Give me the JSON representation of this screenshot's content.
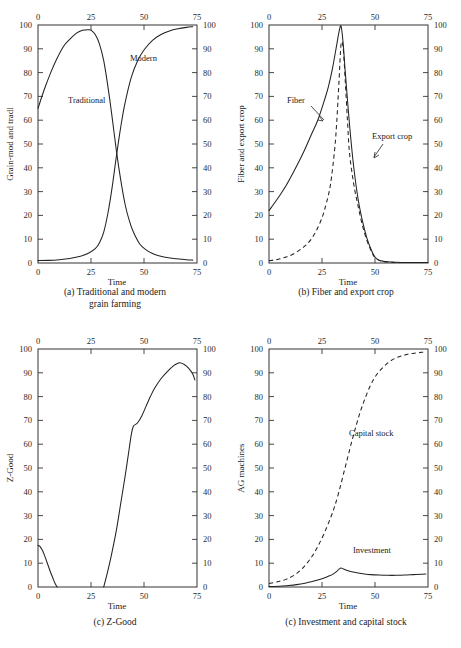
{
  "figure": {
    "panel_count": 4,
    "shared": {
      "xlabel": "Time",
      "xticks": [
        0,
        25,
        50,
        75
      ],
      "yticks": [
        0,
        10,
        20,
        30,
        40,
        50,
        60,
        70,
        80,
        90,
        100
      ],
      "xlim": [
        0,
        75
      ],
      "ylim": [
        0,
        100
      ],
      "line_color": "#222222",
      "frame_color": "#333333",
      "background": "#ffffff"
    }
  },
  "panel_a": {
    "caption_line1": "(a) Traditional and modern",
    "caption_line2": "grain farming",
    "ylabel": "Grain-mod and tradl",
    "xlabel": "Time",
    "xticks": [
      "0",
      "25",
      "50",
      "75"
    ],
    "yticks": [
      "0",
      "10",
      "20",
      "30",
      "40",
      "50",
      "60",
      "70",
      "80",
      "90",
      "100"
    ],
    "labels": {
      "traditional": "Traditional",
      "modern": "Modern"
    },
    "chart_data": {
      "type": "line",
      "title": "(a) Traditional and modern grain farming",
      "xlabel": "Time",
      "ylabel": "Grain-mod and tradl",
      "xlim": [
        0,
        75
      ],
      "ylim": [
        0,
        100
      ],
      "grid": false,
      "legend": "inline-annotations",
      "series": [
        {
          "name": "Traditional",
          "style": "solid",
          "x": [
            0,
            3,
            6,
            9,
            12,
            15,
            18,
            21,
            24,
            25,
            27,
            29,
            31,
            33,
            35,
            37,
            39,
            41,
            43,
            45,
            48,
            51,
            54,
            57,
            60,
            65,
            70,
            73
          ],
          "values": [
            65,
            73,
            80,
            86,
            91,
            94,
            96.5,
            97.8,
            98,
            97.8,
            96,
            92,
            85,
            74,
            61,
            47,
            35,
            25,
            18,
            13,
            8,
            5.5,
            4,
            3,
            2.4,
            1.8,
            1.4,
            1.2
          ]
        },
        {
          "name": "Modern",
          "style": "solid",
          "x": [
            0,
            5,
            10,
            15,
            20,
            24,
            27,
            29,
            31,
            33,
            35,
            37,
            39,
            41,
            44,
            47,
            50,
            54,
            58,
            62,
            66,
            70,
            73
          ],
          "values": [
            1,
            1.1,
            1.4,
            1.9,
            2.8,
            4.2,
            6,
            8.5,
            13,
            21,
            32,
            45,
            57,
            67,
            78,
            85,
            89.5,
            93.5,
            96,
            97.5,
            98.4,
            99,
            99.3
          ]
        }
      ]
    }
  },
  "panel_b": {
    "caption_line1": "(b) Fiber and export crop",
    "caption_line2": "",
    "ylabel": "Fiber and export crop",
    "xlabel": "Time",
    "xticks": [
      "0",
      "25",
      "50",
      "75"
    ],
    "yticks": [
      "0",
      "10",
      "20",
      "30",
      "40",
      "50",
      "60",
      "70",
      "80",
      "90",
      "100"
    ],
    "labels": {
      "fiber": "Fiber",
      "export_crop": "Export crop"
    },
    "chart_data": {
      "type": "line",
      "title": "(b) Fiber and export crop",
      "xlabel": "Time",
      "ylabel": "Fiber and export crop",
      "xlim": [
        0,
        75
      ],
      "ylim": [
        0,
        100
      ],
      "grid": false,
      "legend": "inline-annotations-with-arrows",
      "series": [
        {
          "name": "Fiber",
          "style": "solid",
          "x": [
            0,
            4,
            8,
            12,
            16,
            20,
            23,
            26,
            28,
            30,
            32,
            33,
            34,
            35,
            36,
            38,
            40,
            42,
            44,
            46,
            48,
            50,
            52,
            56,
            60,
            66,
            72,
            75
          ],
          "values": [
            22,
            27,
            32.5,
            39,
            46,
            54,
            60,
            68,
            74,
            82,
            92,
            97,
            99.5,
            92,
            80,
            58,
            40,
            27,
            18,
            11,
            6,
            2.5,
            1.2,
            0.5,
            0.3,
            0.2,
            0.2,
            0.2
          ]
        },
        {
          "name": "Export crop",
          "style": "dashed",
          "x": [
            0,
            4,
            8,
            12,
            16,
            19,
            22,
            25,
            27,
            29,
            31,
            32,
            33,
            34,
            35,
            36,
            37,
            38,
            40,
            42,
            44,
            46,
            48,
            50,
            53,
            58,
            65,
            72,
            75
          ],
          "values": [
            1,
            1.5,
            2.5,
            4,
            6.5,
            9,
            13,
            19,
            25,
            33,
            48,
            60,
            76,
            92,
            90,
            76,
            60,
            46,
            33,
            24,
            16,
            10,
            5.5,
            2.2,
            0.8,
            0.3,
            0.2,
            0.2,
            0.2
          ]
        }
      ]
    }
  },
  "panel_c": {
    "caption_line1": "(c) Z-Good",
    "caption_line2": "",
    "ylabel": "Z-Good",
    "xlabel": "Time",
    "xticks": [
      "0",
      "25",
      "50",
      "75"
    ],
    "yticks": [
      "0",
      "10",
      "20",
      "30",
      "40",
      "50",
      "60",
      "70",
      "80",
      "90",
      "100"
    ],
    "labels": {},
    "chart_data": {
      "type": "line",
      "title": "(c) Z-Good",
      "xlabel": "Time",
      "ylabel": "Z-Good",
      "xlim": [
        0,
        75
      ],
      "ylim": [
        0,
        100
      ],
      "grid": false,
      "legend": "none",
      "series": [
        {
          "name": "Z-Good (initial decline)",
          "style": "solid",
          "x": [
            0,
            1,
            2,
            3,
            4,
            5,
            6,
            7,
            8,
            9
          ],
          "values": [
            17.5,
            17,
            15.5,
            13.5,
            11,
            8.5,
            6,
            3.8,
            1.6,
            0
          ]
        },
        {
          "name": "Z-Good (recovery)",
          "style": "solid",
          "x": [
            31,
            33,
            35,
            37,
            39,
            41,
            43,
            44,
            45,
            47,
            49,
            51,
            53,
            55,
            58,
            61,
            64,
            66,
            67,
            69,
            71,
            73,
            74
          ],
          "values": [
            0,
            7,
            15,
            24,
            35,
            46,
            58,
            64,
            67.5,
            69,
            72,
            76,
            80,
            83.5,
            87.5,
            90.5,
            93,
            94,
            94.2,
            93.5,
            92,
            89.5,
            87
          ]
        }
      ]
    }
  },
  "panel_d": {
    "caption_line1": "(c) Investment and capital stock",
    "caption_line2": "",
    "ylabel": "AG machines",
    "xlabel": "Time",
    "xticks": [
      "0",
      "25",
      "50",
      "75"
    ],
    "yticks": [
      "0",
      "10",
      "20",
      "30",
      "40",
      "50",
      "60",
      "70",
      "80",
      "90",
      "100"
    ],
    "labels": {
      "capital_stock": "Capital stock",
      "investment": "Investment"
    },
    "chart_data": {
      "type": "line",
      "title": "(c) Investment and capital stock",
      "xlabel": "Time",
      "ylabel": "AG machines",
      "xlim": [
        0,
        75
      ],
      "ylim": [
        0,
        100
      ],
      "grid": false,
      "legend": "inline-annotations",
      "series": [
        {
          "name": "Capital stock",
          "style": "dashed",
          "x": [
            0,
            4,
            8,
            12,
            16,
            20,
            23,
            26,
            29,
            31,
            33,
            35,
            37,
            39,
            41,
            43,
            45,
            48,
            51,
            54,
            57,
            60,
            63,
            66,
            69,
            72,
            74
          ],
          "values": [
            1.5,
            2.2,
            3.2,
            5,
            8,
            12.5,
            17,
            22.5,
            29,
            34,
            40,
            47,
            54,
            61,
            67.5,
            73.5,
            78.5,
            85,
            89.5,
            92.5,
            94.8,
            96.3,
            97.2,
            97.9,
            98.3,
            98.6,
            98.8
          ]
        },
        {
          "name": "Investment",
          "style": "solid",
          "x": [
            0,
            5,
            9,
            13,
            17,
            20,
            23,
            26,
            28,
            30,
            32,
            33,
            34,
            35,
            37,
            39,
            42,
            45,
            48,
            52,
            56,
            60,
            64,
            68,
            72,
            74
          ],
          "values": [
            0.2,
            0.3,
            0.6,
            1.0,
            1.6,
            2.2,
            2.9,
            3.8,
            4.5,
            5.3,
            6.6,
            7.5,
            8.0,
            7.6,
            6.9,
            6.4,
            5.9,
            5.5,
            5.2,
            5.0,
            4.9,
            4.9,
            5.0,
            5.2,
            5.4,
            5.5
          ]
        }
      ]
    }
  }
}
